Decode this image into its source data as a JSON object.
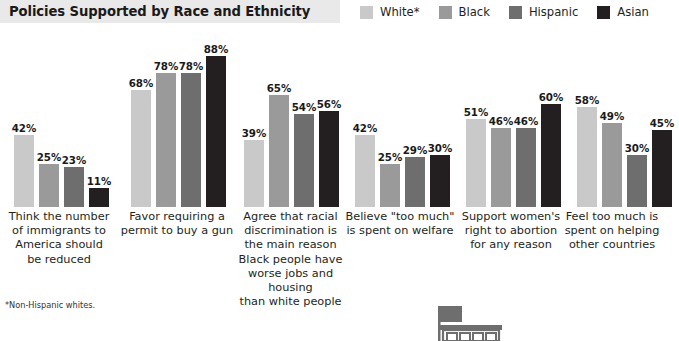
{
  "header": {
    "title": "Policies Supported by Race and Ethnicity"
  },
  "legend": {
    "items": [
      {
        "label": "White*",
        "color": "#c9c9c9"
      },
      {
        "label": "Black",
        "color": "#9a9a9a"
      },
      {
        "label": "Hispanic",
        "color": "#6e6e6e"
      },
      {
        "label": "Asian",
        "color": "#231f20"
      }
    ]
  },
  "footnote": "*Non-Hispanic whites.",
  "bottom_graphic": {
    "name": "storefront-building-illustration",
    "color": "#6e6e6e"
  },
  "chart_data": {
    "type": "bar",
    "title": "Policies Supported by Race and Ethnicity",
    "xlabel": "",
    "ylabel": "",
    "ylim": [
      0,
      100
    ],
    "grid": false,
    "legend_position": "top-right",
    "value_suffix": "%",
    "categories": [
      "Think the number of immigrants to America should be reduced",
      "Favor requiring a permit to buy a gun",
      "Agree that racial discrimination is the main reason Black people have worse jobs and housing than white people",
      "Believe \"too much\" is spent on welfare",
      "Support women's right to abortion for any reason",
      "Feel too much is spent on helping other countries"
    ],
    "category_lines": [
      [
        "Think the number",
        "of immigrants to",
        "America should",
        "be reduced"
      ],
      [
        "Favor requiring a",
        "permit to buy a gun"
      ],
      [
        "Agree that racial",
        "discrimination is",
        "the main reason",
        "Black people have",
        "worse jobs and housing",
        "than white people"
      ],
      [
        "Believe \"too much\"",
        "is spent on welfare"
      ],
      [
        "Support women's",
        "right to abortion",
        "for any reason"
      ],
      [
        "Feel too much is",
        "spent on helping",
        "other countries"
      ]
    ],
    "series": [
      {
        "name": "White*",
        "color": "#c9c9c9",
        "values": [
          42,
          68,
          39,
          42,
          51,
          58
        ]
      },
      {
        "name": "Black",
        "color": "#9a9a9a",
        "values": [
          25,
          78,
          65,
          25,
          46,
          49
        ]
      },
      {
        "name": "Hispanic",
        "color": "#6e6e6e",
        "values": [
          23,
          78,
          54,
          29,
          46,
          30
        ]
      },
      {
        "name": "Asian",
        "color": "#231f20",
        "values": [
          11,
          88,
          56,
          30,
          60,
          45
        ]
      }
    ],
    "labels": [
      [
        "42%",
        "25%",
        "23%",
        "11%"
      ],
      [
        "68%",
        "78%",
        "78%",
        "88%"
      ],
      [
        "39%",
        "65%",
        "54%",
        "56%"
      ],
      [
        "42%",
        "25%",
        "29%",
        "30%"
      ],
      [
        "51%",
        "46%",
        "46%",
        "60%"
      ],
      [
        "58%",
        "49%",
        "30%",
        "45%"
      ]
    ]
  },
  "layout": {
    "group_left": [
      14,
      131,
      244,
      355,
      466,
      577
    ],
    "label_left": [
      0,
      118,
      228,
      340,
      452,
      563
    ],
    "label_width": [
      118,
      118,
      125,
      120,
      118,
      98
    ],
    "bar_width": 20,
    "bar_gap": 5,
    "plot_height": 184,
    "px_per_percent": 1.72
  }
}
